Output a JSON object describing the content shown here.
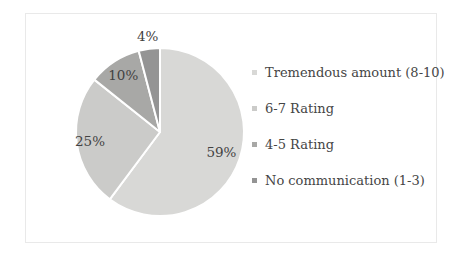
{
  "chart_data": {
    "type": "pie",
    "title": "",
    "categories": [
      "Tremendous amount (8-10)",
      "6-7 Rating",
      "4-5 Rating",
      "No communication (1-3)"
    ],
    "values": [
      59,
      25,
      10,
      4
    ],
    "data_labels": [
      "59%",
      "25%",
      "10%",
      "4%"
    ],
    "colors": [
      "#d8d8d6",
      "#cbcbc9",
      "#a8a8a6",
      "#949494"
    ],
    "slice_border_color": "#ffffff",
    "label_text_color": "#424242",
    "legend_position": "right",
    "start_angle_deg": 0,
    "direction": "clockwise",
    "label_radius_factors": [
      0.77,
      0.84,
      0.8,
      1.15
    ]
  },
  "legend": {
    "items": [
      {
        "label": "Tremendous amount (8-10)",
        "color": "#d8d8d6"
      },
      {
        "label": "6-7 Rating",
        "color": "#cbcbc9"
      },
      {
        "label": "4-5 Rating",
        "color": "#a8a8a6"
      },
      {
        "label": "No communication (1-3)",
        "color": "#949494"
      }
    ]
  },
  "frame": {
    "border_color": "#e9e9e9",
    "background": "#ffffff"
  }
}
